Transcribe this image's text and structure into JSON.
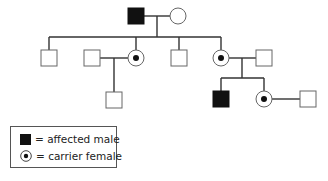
{
  "diagram": {
    "type": "pedigree",
    "colors": {
      "line": "#333333",
      "affected_fill": "#111111",
      "unaffected_fill": "#ffffff",
      "stroke": "#666666"
    },
    "generations": [
      {
        "id": "I",
        "individuals": [
          {
            "id": "I-1",
            "sex": "male",
            "status": "affected"
          },
          {
            "id": "I-2",
            "sex": "female",
            "status": "unaffected"
          }
        ]
      },
      {
        "id": "II",
        "individuals": [
          {
            "id": "II-1",
            "sex": "male",
            "status": "unaffected"
          },
          {
            "id": "II-2-spouse",
            "sex": "male",
            "status": "unaffected",
            "married_in": true
          },
          {
            "id": "II-2",
            "sex": "female",
            "status": "carrier"
          },
          {
            "id": "II-3",
            "sex": "male",
            "status": "unaffected"
          },
          {
            "id": "II-4",
            "sex": "female",
            "status": "carrier"
          },
          {
            "id": "II-4-spouse",
            "sex": "male",
            "status": "unaffected",
            "married_in": true
          }
        ]
      },
      {
        "id": "III",
        "individuals": [
          {
            "id": "III-1",
            "sex": "male",
            "status": "unaffected",
            "parents": [
              "II-2",
              "II-2-spouse"
            ]
          },
          {
            "id": "III-2",
            "sex": "male",
            "status": "affected",
            "parents": [
              "II-4",
              "II-4-spouse"
            ]
          },
          {
            "id": "III-3",
            "sex": "female",
            "status": "carrier",
            "parents": [
              "II-4",
              "II-4-spouse"
            ]
          },
          {
            "id": "III-3-spouse",
            "sex": "male",
            "status": "unaffected",
            "married_in": true
          }
        ]
      }
    ]
  },
  "legend": {
    "items": [
      {
        "symbol": "filled-square",
        "label": "= affected male"
      },
      {
        "symbol": "dotted-circle",
        "label": "= carrier female"
      }
    ]
  }
}
